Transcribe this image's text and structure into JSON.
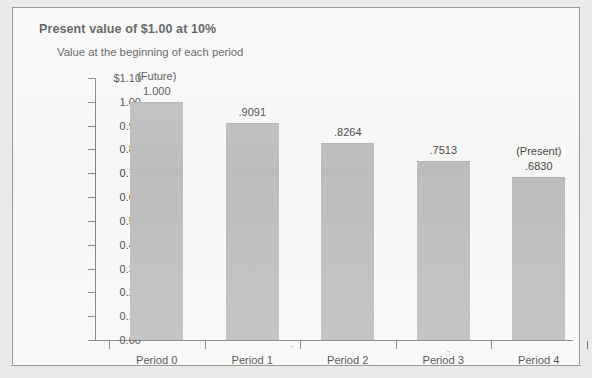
{
  "figure": {
    "title": "Present value of $1.00 at 10%",
    "subtitle": "Value at the beginning of each period"
  },
  "colors": {
    "bar_fill": "#b3b3b3",
    "axis": "#6d6d6d",
    "frame_border": "#9a9a9a",
    "panel_background": "#f7f7f6",
    "page_background": "#eaeaea",
    "text": "#1f1f1f"
  },
  "chart_data": {
    "type": "bar",
    "title": "Present value of $1.00 at 10%",
    "subtitle": "Value at the beginning of each period",
    "xlabel": "",
    "ylabel": "",
    "categories": [
      "Period 0",
      "Period 1",
      "Period 2",
      "Period 3",
      "Period 4"
    ],
    "values": [
      1.0,
      0.9091,
      0.8264,
      0.7513,
      0.683
    ],
    "data_labels": [
      "1.000",
      ".9091",
      ".8264",
      ".7513",
      ".6830"
    ],
    "point_notes": [
      "(Future)",
      "",
      "",
      "",
      "(Present)"
    ],
    "ylim": [
      0.0,
      1.1
    ],
    "ytick_values": [
      1.1,
      1.0,
      0.9,
      0.8,
      0.7,
      0.6,
      0.5,
      0.4,
      0.3,
      0.2,
      0.1,
      0.0
    ],
    "ytick_labels": [
      "$1.10",
      "1.00",
      "0.90",
      "0.80",
      "0.70",
      "0.60",
      "0.50",
      "0.40",
      "0.30",
      "0.20",
      "0.10",
      "0.00"
    ],
    "grid": false,
    "legend": false,
    "legend_position": "none",
    "series": [
      {
        "name": "Present value of $1.00 at 10%",
        "values": [
          1.0,
          0.9091,
          0.8264,
          0.7513,
          0.683
        ]
      }
    ],
    "annotations": [
      {
        "category": "Period 0",
        "text": "(Future)"
      },
      {
        "category": "Period 4",
        "text": "(Present)"
      }
    ]
  }
}
